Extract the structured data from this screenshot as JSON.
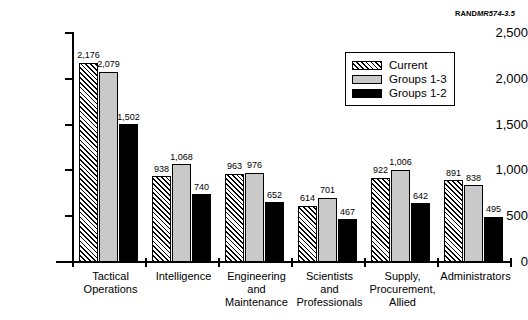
{
  "figure_id": {
    "prefix": "RAND",
    "suffix": "MR574-3.5",
    "full": "RANDMR574-3.5"
  },
  "legend": {
    "position": "top-right",
    "entries": [
      {
        "label": "Current",
        "swatch": "hatch-diagonal",
        "color": "#ffffff"
      },
      {
        "label": "Groups 1-3",
        "swatch": "solid",
        "color": "#c9c9c9"
      },
      {
        "label": "Groups 1-2",
        "swatch": "solid",
        "color": "#000000"
      }
    ]
  },
  "chart_data": {
    "type": "bar",
    "title": "",
    "subtitle": "",
    "xlabel": "",
    "ylabel": "",
    "ylim": [
      0,
      2500
    ],
    "yticks": [
      0,
      500,
      1000,
      1500,
      2000,
      2500
    ],
    "ytick_labels": [
      "0",
      "500",
      "1,000",
      "1,500",
      "2,000",
      "2,500"
    ],
    "grid": false,
    "legend_position": "top-right",
    "categories": [
      "Tactical Operations",
      "Intelligence",
      "Engineering and Maintenance",
      "Scientists and Professionals",
      "Supply, Procurement, Allied",
      "Administrators"
    ],
    "category_lines": [
      [
        "Tactical",
        "Operations"
      ],
      [
        "Intelligence"
      ],
      [
        "Engineering",
        "and",
        "Maintenance"
      ],
      [
        "Scientists",
        "and",
        "Professionals"
      ],
      [
        "Supply,",
        "Procurement,",
        "Allied"
      ],
      [
        "Administrators"
      ]
    ],
    "series": [
      {
        "name": "Current",
        "values": [
          2176,
          938,
          963,
          614,
          922,
          891
        ],
        "labels": [
          "2,176",
          "938",
          "963",
          "614",
          "922",
          "891"
        ]
      },
      {
        "name": "Groups 1-3",
        "values": [
          2079,
          1068,
          976,
          701,
          1006,
          838
        ],
        "labels": [
          "2,079",
          "1,068",
          "976",
          "701",
          "1,006",
          "838"
        ]
      },
      {
        "name": "Groups 1-2",
        "values": [
          1502,
          740,
          652,
          467,
          642,
          495
        ],
        "labels": [
          "1,502",
          "740",
          "652",
          "467",
          "642",
          "495"
        ]
      }
    ]
  }
}
